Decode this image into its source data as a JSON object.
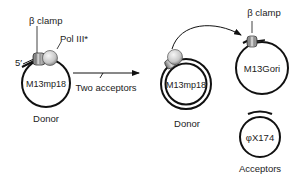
{
  "left_panel": {
    "clamp_label": "β clamp",
    "pol_label": "Pol III*",
    "five_prime_label": "5′",
    "circle_label": "M13mp18",
    "caption": "Donor"
  },
  "arrow": {
    "label": "Two acceptors"
  },
  "right_panel": {
    "donor_circle_label": "M13mp18",
    "donor_caption": "Donor",
    "clamp_label": "β clamp",
    "acceptor1_label": "M13Gori",
    "acceptor2_label": "φX174",
    "acceptors_caption": "Acceptors"
  },
  "colors": {
    "ink": "#111111",
    "protein_light": "#e0e0e0",
    "protein_dark": "#8a8a8a"
  }
}
